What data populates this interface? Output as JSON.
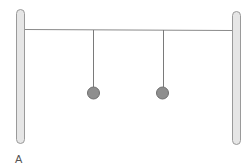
{
  "diagram": {
    "type": "physics-pendulum-setup",
    "caption_label": "A",
    "pendulum_count": 2,
    "colors": {
      "post_fill": "#e6e6e6",
      "post_stroke": "#9a9a9a",
      "bar": "#8a8a8a",
      "string": "#7a7a7a",
      "bob_fill": "#8e8e8e",
      "bob_stroke": "#6e6e6e"
    }
  }
}
